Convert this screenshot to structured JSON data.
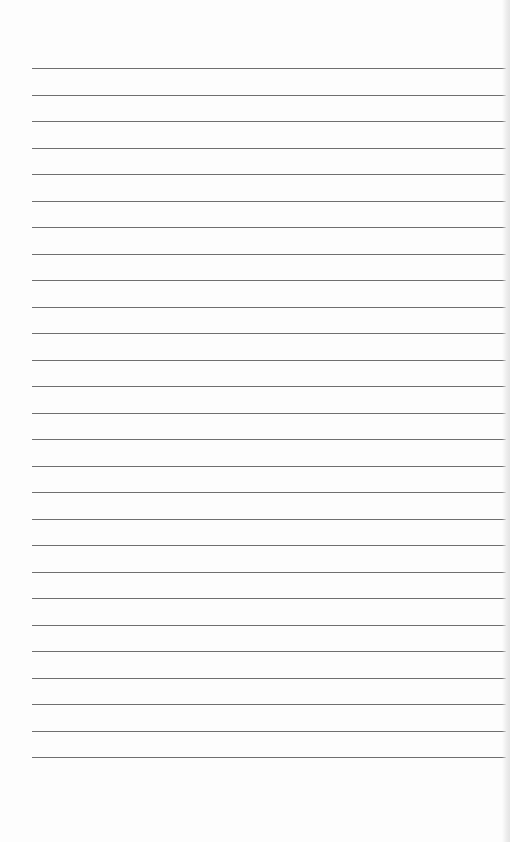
{
  "page": {
    "type": "lined-notepaper",
    "background_color": "#fdfdfd",
    "line_color": "#6f6f6f",
    "line_count": 27,
    "first_line_y": 68,
    "line_spacing": 26.5,
    "line_left_x": 32
  }
}
